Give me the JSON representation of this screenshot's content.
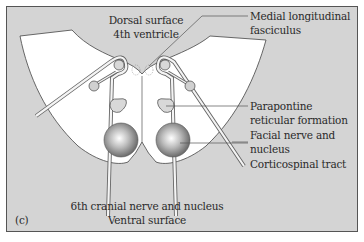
{
  "figure": {
    "panel_label": "(c)",
    "colors": {
      "background": "#d4d4d4",
      "frame": "#555555",
      "tissue": "#ffffff",
      "outline": "#444444",
      "nucleus_fill": "#c8c8c8",
      "tract_dark": "#6a6a6a",
      "tract_light": "#f4f4f4"
    }
  },
  "labels": {
    "dorsal_surface": "Dorsal surface",
    "fourth_ventricle": "4th ventricle",
    "mlf_line1": "Medial longitudinal",
    "mlf_line2": "fasciculus",
    "pprf_line1": "Parapontine",
    "pprf_line2": "reticular formation",
    "facial_line1": "Facial nerve and",
    "facial_line2": "nucleus",
    "corticospinal": "Corticospinal tract",
    "sixth_nerve": "6th cranial nerve and nucleus",
    "ventral_surface": "Ventral surface"
  }
}
